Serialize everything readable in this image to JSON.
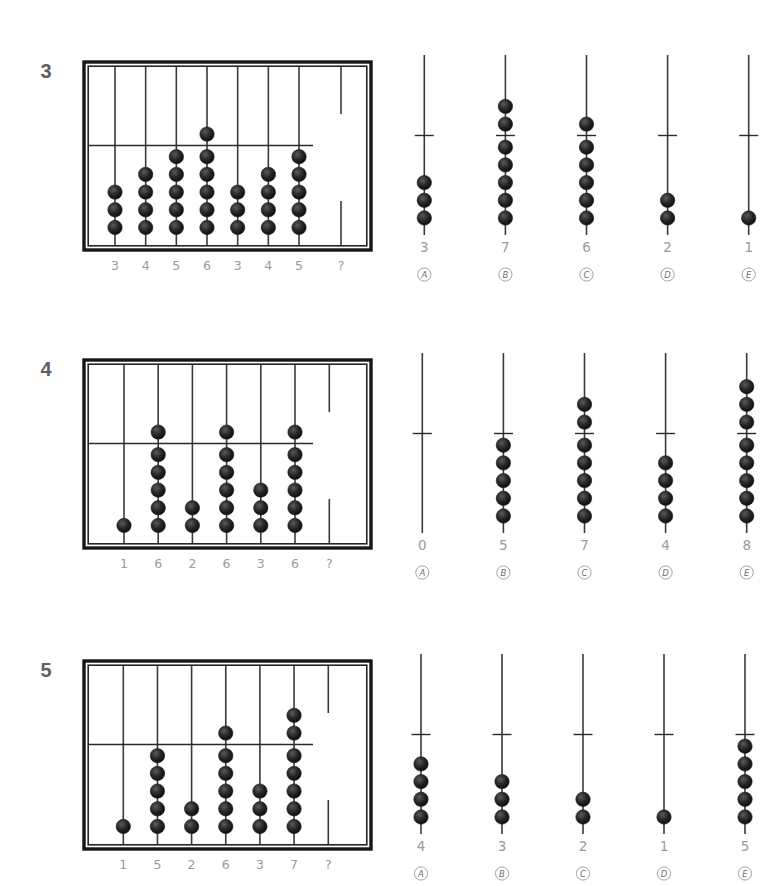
{
  "puzzles": [
    {
      "number": "3",
      "abacus_values": [
        3,
        4,
        5,
        6,
        3,
        4,
        5
      ],
      "unknown_label": "?",
      "options": [
        {
          "letter": "A",
          "value": 3
        },
        {
          "letter": "B",
          "value": 7
        },
        {
          "letter": "C",
          "value": 6
        },
        {
          "letter": "D",
          "value": 2
        },
        {
          "letter": "E",
          "value": 1
        }
      ]
    },
    {
      "number": "4",
      "abacus_values": [
        1,
        6,
        2,
        6,
        3,
        6
      ],
      "unknown_label": "?",
      "options": [
        {
          "letter": "A",
          "value": 0
        },
        {
          "letter": "B",
          "value": 5
        },
        {
          "letter": "C",
          "value": 7
        },
        {
          "letter": "D",
          "value": 4
        },
        {
          "letter": "E",
          "value": 8
        }
      ]
    },
    {
      "number": "5",
      "abacus_values": [
        1,
        5,
        2,
        6,
        3,
        7
      ],
      "unknown_label": "?",
      "options": [
        {
          "letter": "A",
          "value": 4
        },
        {
          "letter": "B",
          "value": 3
        },
        {
          "letter": "C",
          "value": 2
        },
        {
          "letter": "D",
          "value": 1
        },
        {
          "letter": "E",
          "value": 5
        }
      ]
    }
  ],
  "colors": {
    "bead": "#1e1e1e",
    "frame": "#161616",
    "label_gray": "#9a9a9a",
    "number_gray": "#5f5f5f"
  }
}
